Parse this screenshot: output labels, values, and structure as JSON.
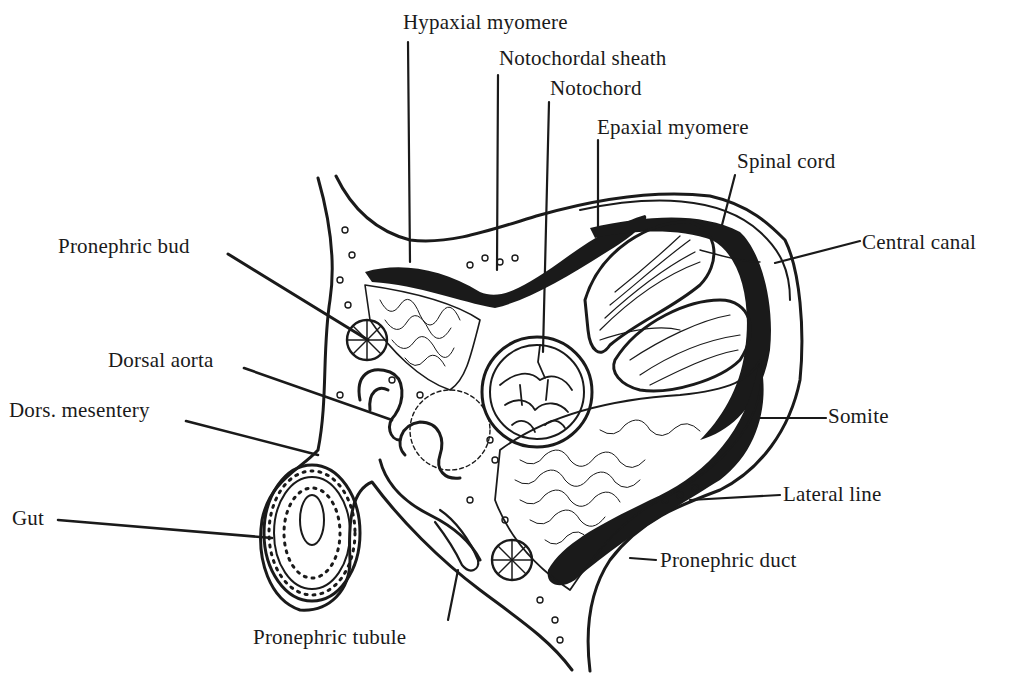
{
  "diagram": {
    "background": "#ffffff",
    "ink": "#1a1a1a",
    "labels": [
      {
        "id": "hypaxial-myomere",
        "text": "Hypaxial myomere",
        "x": 403,
        "y": 12
      },
      {
        "id": "notochordal-sheath",
        "text": "Notochordal sheath",
        "x": 499,
        "y": 48
      },
      {
        "id": "notochord",
        "text": "Notochord",
        "x": 550,
        "y": 78
      },
      {
        "id": "epaxial-myomere",
        "text": "Epaxial myomere",
        "x": 597,
        "y": 117
      },
      {
        "id": "spinal-cord",
        "text": "Spinal cord",
        "x": 737,
        "y": 151
      },
      {
        "id": "central-canal",
        "text": "Central canal",
        "x": 862,
        "y": 232
      },
      {
        "id": "pronephric-bud",
        "text": "Pronephric bud",
        "x": 58,
        "y": 236
      },
      {
        "id": "dorsal-aorta",
        "text": "Dorsal aorta",
        "x": 108,
        "y": 350
      },
      {
        "id": "dors-mesentery",
        "text": "Dors. mesentery",
        "x": 9,
        "y": 400
      },
      {
        "id": "somite",
        "text": "Somite",
        "x": 828,
        "y": 406
      },
      {
        "id": "lateral-line",
        "text": "Lateral line",
        "x": 783,
        "y": 484
      },
      {
        "id": "gut",
        "text": "Gut",
        "x": 12,
        "y": 508
      },
      {
        "id": "pronephric-duct",
        "text": "Pronephric duct",
        "x": 660,
        "y": 550
      },
      {
        "id": "pronephric-tubule",
        "text": "Pronephric tubule",
        "x": 253,
        "y": 627
      }
    ]
  }
}
